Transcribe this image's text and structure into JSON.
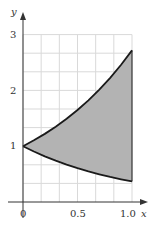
{
  "chart_data": {
    "type": "area",
    "title": "",
    "xlabel": "x",
    "ylabel": "y",
    "xlim": [
      0,
      1.0
    ],
    "ylim": [
      0,
      3
    ],
    "grid": true,
    "x_ticks": [
      "0",
      "0.5",
      "1.0"
    ],
    "y_ticks": [
      "1",
      "2",
      "3"
    ],
    "series": [
      {
        "name": "upper curve (y = e^x)",
        "x": [
          0,
          0.1,
          0.2,
          0.3,
          0.4,
          0.5,
          0.6,
          0.7,
          0.8,
          0.9,
          1.0
        ],
        "values": [
          1.0,
          1.105,
          1.221,
          1.35,
          1.492,
          1.649,
          1.822,
          2.014,
          2.226,
          2.46,
          2.718
        ]
      },
      {
        "name": "lower curve (y = e^-x)",
        "x": [
          0,
          0.1,
          0.2,
          0.3,
          0.4,
          0.5,
          0.6,
          0.7,
          0.8,
          0.9,
          1.0
        ],
        "values": [
          1.0,
          0.905,
          0.819,
          0.741,
          0.67,
          0.607,
          0.549,
          0.497,
          0.449,
          0.407,
          0.368
        ]
      }
    ],
    "shaded_region": "area between upper and lower curves for 0 ≤ x ≤ 1",
    "colors": {
      "fill": "#b3b3b3",
      "curve": "#1a1a1a",
      "grid": "#d9d9d9",
      "axis": "#333333"
    }
  },
  "labels": {
    "x_axis": "x",
    "y_axis": "y",
    "tick_x0": "0",
    "tick_x05": "0.5",
    "tick_x1": "1.0",
    "tick_y1": "1",
    "tick_y2": "2",
    "tick_y3": "3"
  }
}
